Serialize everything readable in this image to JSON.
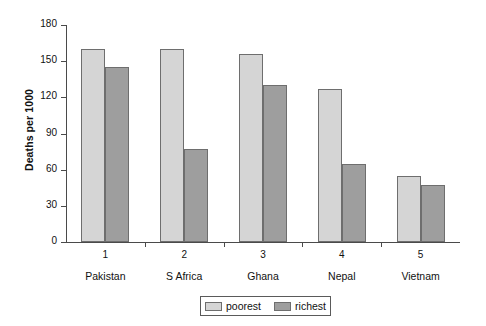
{
  "chart_data": {
    "type": "bar",
    "title": "",
    "subtitle": "",
    "xlabel": "",
    "ylabel": "Deaths per 1000",
    "categories": [
      "Pakistan",
      "S Africa",
      "Ghana",
      "Nepal",
      "Vietnam"
    ],
    "category_numbers": [
      "1",
      "2",
      "3",
      "4",
      "5"
    ],
    "series": [
      {
        "name": "poorest",
        "color": "#d5d5d5",
        "values": [
          160,
          160,
          156,
          127,
          55
        ]
      },
      {
        "name": "richest",
        "color": "#9e9e9e",
        "values": [
          145,
          77,
          130,
          65,
          47
        ]
      }
    ],
    "ylim": [
      0,
      180
    ],
    "yticks": [
      0,
      30,
      60,
      90,
      120,
      150,
      180
    ],
    "ytick_labels": [
      "0",
      "30",
      "60",
      "90",
      "120",
      "150",
      "180"
    ],
    "grid": false,
    "legend_position": "bottom-center",
    "legend_entries": [
      "poorest",
      "richest"
    ]
  },
  "axes": {
    "y_title": "Deaths per 1000"
  },
  "legend": {
    "poorest_label": "poorest",
    "richest_label": "richest"
  }
}
